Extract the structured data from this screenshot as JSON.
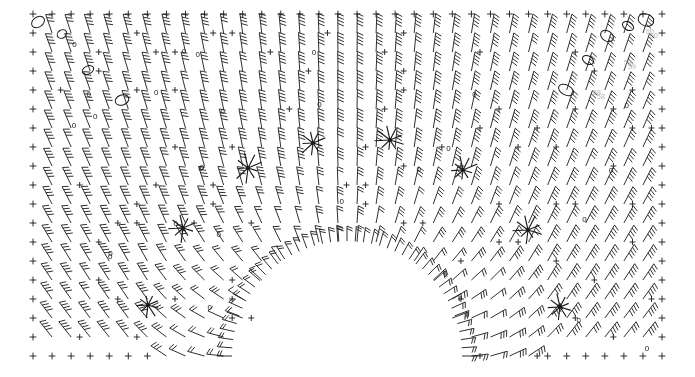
{
  "figure": {
    "title": "",
    "background_color": "#ffffff",
    "ink_color": "#1a1a1a",
    "faint_label_color": "#b4b4b4",
    "width": 695,
    "height": 377
  },
  "chart_data": {
    "type": "scatter",
    "plot_kind": "wind-barb-vector-field-with-contours",
    "title": "",
    "subtitle": "",
    "xlabel": "",
    "ylabel": "",
    "xlim": [
      0,
      695
    ],
    "ylim": [
      0,
      377
    ],
    "grid": false,
    "legend_position": "none",
    "tick_labels": {
      "x": [],
      "y": []
    },
    "legend_entries": [],
    "annotations": [
      "58",
      "59",
      "60"
    ],
    "contour_labels": [
      "0",
      "0",
      "0",
      "0",
      "0",
      "0",
      "0",
      "0",
      "0",
      "0",
      "0",
      "0",
      "0",
      "0",
      "0",
      "0",
      "0",
      "0",
      "0",
      "0",
      "0",
      "0",
      "0",
      "0",
      "0",
      "0"
    ],
    "domain": {
      "outer_left": 33,
      "outer_right": 662,
      "outer_top": 14,
      "outer_bottom": 356,
      "arch_center_x": 347,
      "arch_outer_radius": 215,
      "arch_inner_radius": 110,
      "arch_base_y": 356
    },
    "grid_layout": {
      "columns": 34,
      "rows": 19,
      "col_spacing": 19.1,
      "row_spacing": 19.0
    },
    "barb_style": {
      "shaft_length": 17,
      "tick_length": 6,
      "ticks_per_barb_range": [
        1,
        4
      ],
      "pennant_marker": "+"
    },
    "convergence_points": [
      {
        "x": 183,
        "y": 228,
        "label": "saddle-left-inner"
      },
      {
        "x": 248,
        "y": 168,
        "label": "focus-left-arch"
      },
      {
        "x": 313,
        "y": 143,
        "label": "focus-left-top"
      },
      {
        "x": 390,
        "y": 140,
        "label": "focus-right-top"
      },
      {
        "x": 463,
        "y": 170,
        "label": "focus-right-arch"
      },
      {
        "x": 528,
        "y": 230,
        "label": "saddle-right-inner"
      },
      {
        "x": 148,
        "y": 305,
        "label": "focus-bottom-left"
      },
      {
        "x": 560,
        "y": 307,
        "label": "focus-bottom-right"
      }
    ],
    "closed_contour_loops": [
      {
        "x": 38,
        "y": 22,
        "rx": 7,
        "ry": 5,
        "angle": -35
      },
      {
        "x": 62,
        "y": 34,
        "rx": 5,
        "ry": 4,
        "angle": -30
      },
      {
        "x": 88,
        "y": 70,
        "rx": 6,
        "ry": 4,
        "angle": -25
      },
      {
        "x": 122,
        "y": 100,
        "rx": 7,
        "ry": 5,
        "angle": -20
      },
      {
        "x": 607,
        "y": 36,
        "rx": 7,
        "ry": 5,
        "angle": 35
      },
      {
        "x": 628,
        "y": 26,
        "rx": 6,
        "ry": 4,
        "angle": 30
      },
      {
        "x": 588,
        "y": 60,
        "rx": 6,
        "ry": 4,
        "angle": 30
      },
      {
        "x": 566,
        "y": 90,
        "rx": 8,
        "ry": 5,
        "angle": 28
      },
      {
        "x": 646,
        "y": 20,
        "rx": 8,
        "ry": 6,
        "angle": 20
      }
    ],
    "series": [
      {
        "name": "vector_field",
        "description": "dense grid of wind-barb glyphs; direction rotates from vertical at outer top edge through radial alignment around a central semicircular arch, with flow turning horizontal along the lower flanks",
        "n_glyphs": 646
      }
    ]
  },
  "annotations": {
    "corner_labels": [
      {
        "text": "58",
        "x": 597,
        "y": 93
      },
      {
        "text": "59",
        "x": 628,
        "y": 63
      },
      {
        "text": "60",
        "x": 650,
        "y": 32
      }
    ]
  }
}
